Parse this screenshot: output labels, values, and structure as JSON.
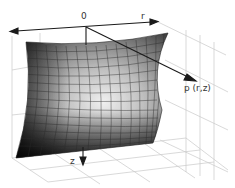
{
  "figure": {
    "type": "3d-surface-diagram",
    "labels": {
      "origin": "0",
      "r_axis": "r",
      "z_axis": "z",
      "point": "p (r,z)"
    },
    "colors": {
      "background": "#ffffff",
      "axis": "#1a1a1a",
      "grid": "#c8c8c8",
      "surface_dark": "#111111",
      "surface_light": "#e8e8e8",
      "mesh": "#2a2a2a"
    }
  }
}
